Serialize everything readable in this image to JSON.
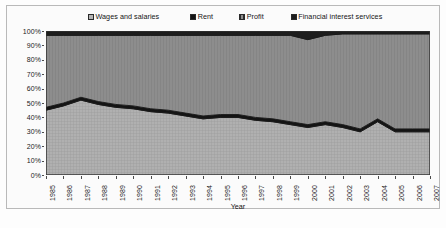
{
  "chart_data": {
    "type": "area",
    "stacked": "100%",
    "title": "",
    "xlabel": "Year",
    "ylabel": "",
    "ylim": [
      0,
      100
    ],
    "ytick_labels": [
      "100%",
      "90%",
      "80%",
      "70%",
      "60%",
      "50%",
      "40%",
      "30%",
      "20%",
      "10%",
      "0%"
    ],
    "ytick_values": [
      100,
      90,
      80,
      70,
      60,
      50,
      40,
      30,
      20,
      10,
      0
    ],
    "grid": false,
    "legend_position": "top",
    "categories": [
      "1985",
      "1986",
      "1987",
      "1988",
      "1989",
      "1990",
      "1991",
      "1992",
      "1993",
      "1994",
      "1995",
      "1996",
      "1997",
      "1998",
      "1999",
      "2000",
      "2001",
      "2002",
      "2003",
      "2004",
      "2005",
      "2006",
      "2007"
    ],
    "series": [
      {
        "name": "Wages and salaries",
        "color": "#b0b0b0",
        "values": [
          45,
          48,
          52,
          49,
          47,
          46,
          44,
          43,
          41,
          39,
          40,
          40,
          38,
          37,
          35,
          33,
          35,
          33,
          30,
          37,
          30,
          30,
          30
        ]
      },
      {
        "name": "Rent",
        "color": "#141414",
        "values": [
          2,
          2,
          2,
          2,
          2,
          2,
          2,
          2,
          2,
          2,
          2,
          2,
          2,
          2,
          2,
          2,
          2,
          2,
          2,
          2,
          2,
          2,
          2
        ]
      },
      {
        "name": "Profit",
        "color": "#8d8d8d",
        "values": [
          50,
          47,
          43,
          46,
          48,
          49,
          51,
          52,
          54,
          56,
          55,
          55,
          57,
          58,
          60,
          59,
          60,
          63,
          66,
          59,
          66,
          66,
          66
        ]
      },
      {
        "name": "Financial interest services",
        "color": "#1d1d1d",
        "values": [
          3,
          3,
          3,
          3,
          3,
          3,
          3,
          3,
          3,
          3,
          3,
          3,
          3,
          3,
          3,
          6,
          3,
          2,
          2,
          2,
          2,
          2,
          2
        ]
      }
    ]
  },
  "legend": {
    "items": [
      {
        "label": "Wages and salaries",
        "swatch": "wages-swatch-icon"
      },
      {
        "label": "Rent",
        "swatch": "rent-swatch-icon"
      },
      {
        "label": "Profit",
        "swatch": "profit-swatch-icon"
      },
      {
        "label": "Financial interest services",
        "swatch": "financial-interest-services-swatch-icon"
      }
    ]
  },
  "axes": {
    "x_title": "Year"
  },
  "caption": {
    "text": ""
  }
}
